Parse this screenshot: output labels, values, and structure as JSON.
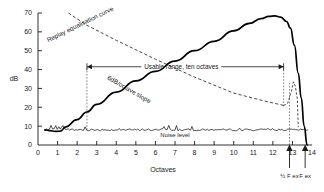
{
  "chart_data": {
    "type": "line",
    "title": "",
    "xlabel": "Octaves",
    "ylabel": "dB",
    "xlim": [
      0,
      14
    ],
    "ylim": [
      0,
      70
    ],
    "grid": false,
    "legend": "none",
    "xticks": [
      "0",
      "1",
      "2",
      "3",
      "4",
      "5",
      "6",
      "7",
      "8",
      "9",
      "10",
      "11",
      "12",
      "13",
      "14"
    ],
    "xtick_values": [
      0,
      1,
      2,
      3,
      4,
      5,
      6,
      7,
      8,
      9,
      10,
      11,
      12,
      13,
      14
    ],
    "yticks": [
      "0",
      "10",
      "20",
      "30",
      "40",
      "50",
      "60",
      "70"
    ],
    "ytick_values": [
      0,
      10,
      20,
      30,
      40,
      50,
      60,
      70
    ],
    "series": [
      {
        "name": "Record/replay response",
        "style": "solid",
        "x": [
          0.35,
          0.6,
          0.9,
          1.15,
          1.4,
          2.0,
          2.5,
          3.0,
          4.0,
          5.0,
          6.0,
          7.0,
          8.0,
          9.0,
          10.0,
          10.8,
          11.4,
          11.8,
          12.1,
          12.4,
          12.7,
          12.9,
          13.1,
          13.3,
          13.45,
          13.6,
          13.75
        ],
        "y": [
          8.0,
          7.6,
          7.2,
          7.4,
          9.5,
          13.5,
          17.5,
          21.5,
          28.0,
          34.0,
          39.0,
          44.5,
          50.0,
          55.0,
          60.5,
          64.5,
          67.0,
          68.2,
          68.5,
          67.8,
          65.5,
          62.0,
          53.0,
          38.0,
          25.0,
          10.0,
          0.0
        ]
      },
      {
        "name": "Noise level",
        "style": "noise-band",
        "x_range": [
          0.35,
          13.8
        ],
        "y_mean": 8.0,
        "y_jitter": 1.4
      },
      {
        "name": "Replay equalisation curve",
        "style": "dashed",
        "x": [
          1.55,
          2.5,
          4.0,
          6.0,
          8.0,
          10.0,
          11.5,
          12.55
        ],
        "y": [
          70.0,
          63.5,
          55.5,
          45.5,
          36.0,
          27.5,
          23.5,
          21.0
        ]
      },
      {
        "name": "Replay resonance bump",
        "style": "dashed",
        "x": [
          12.55,
          12.75,
          12.95,
          13.05,
          13.15,
          13.25,
          13.3
        ],
        "y": [
          21.0,
          22.0,
          28.5,
          33.5,
          31.0,
          24.5,
          9.5
        ]
      }
    ],
    "annotations": [
      {
        "name": "replay-eq-label",
        "text": "Replay equalisation curve",
        "x": 2.2,
        "y": 63.0,
        "rotation": -26
      },
      {
        "name": "slope-label",
        "text": "6dB/octave slope",
        "x": 4.6,
        "y": 28.5,
        "rotation": 30
      },
      {
        "name": "usable-range-label",
        "text": "Usable range, ten octaves",
        "x": 7.1,
        "y": 41.5,
        "rotation": 0
      },
      {
        "name": "noise-level-label",
        "text": "Noise level",
        "x": 7.0,
        "y": 4.5,
        "rotation": 0
      }
    ],
    "markers": [
      {
        "name": "usable-range-start",
        "type": "vertical-dotted",
        "x": 2.5,
        "y_from": 8.0,
        "y_to": 41.5
      },
      {
        "name": "usable-range-end",
        "type": "vertical-dotted",
        "x": 12.55,
        "y_from": 20.5,
        "y_to": 41.5
      },
      {
        "name": "half-fex-line",
        "type": "vertical-dotted",
        "x": 12.85,
        "y_from": 0.0,
        "y_to": 33.0
      },
      {
        "name": "half-fex-arrow",
        "type": "up-arrow",
        "x": 12.85,
        "label": "½ F ex"
      },
      {
        "name": "fex-arrow",
        "type": "up-arrow",
        "x": 13.65,
        "label": "F ex"
      }
    ],
    "range_arrow": {
      "name": "usable-range-arrow",
      "x_start": 2.5,
      "x_end": 12.55,
      "y": 41.5,
      "label": "Usable range, ten octaves"
    },
    "axis_bottom_labels": [
      {
        "name": "half-fex-label",
        "text": "½ F ex",
        "x": 12.85
      },
      {
        "name": "fex-label",
        "text": "F ex",
        "x": 13.65
      }
    ]
  }
}
